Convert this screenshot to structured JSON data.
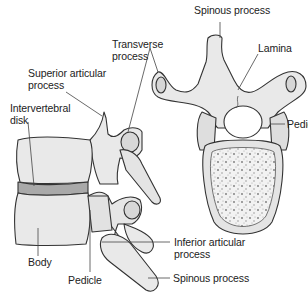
{
  "diagram": {
    "views": {
      "lateral": {
        "labels": {
          "superior_articular_process": "Superior articular\nprocess",
          "intervertebral_disk": "Intervertebral\ndisk",
          "body": "Body",
          "pedicle": "Pedicle",
          "inferior_articular_process": "Inferior articular\nprocess",
          "spinous_process": "Spinous process",
          "transverse_process": "Transverse\nprocess"
        }
      },
      "superior": {
        "labels": {
          "spinous_process": "Spinous process",
          "lamina": "Lamina",
          "pedicle": "Pedicle"
        }
      }
    },
    "colors": {
      "bone_fill": "#e9e9e9",
      "bone_shade": "#c8c8c8",
      "disk_fill": "#a9a9a9",
      "outline": "#333333",
      "leader": "#444444",
      "text": "#222222"
    }
  }
}
